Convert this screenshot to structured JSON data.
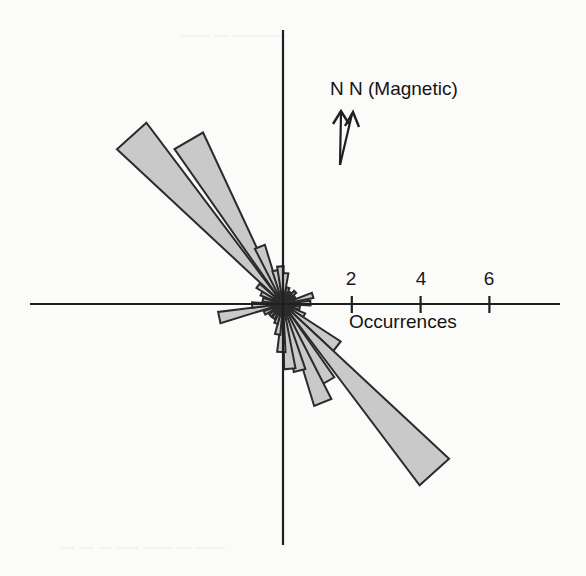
{
  "figure": {
    "background_color": "#fbfbfa",
    "petal_fill_color": "#c9c9c9",
    "petal_stroke_color": "#2b2b2b",
    "axis_color": "#1f1f1f"
  },
  "axis": {
    "title": "Occurrences",
    "tick_labels": [
      "2",
      "4",
      "6"
    ],
    "tick_values": [
      2,
      4,
      6
    ]
  },
  "north_marker": {
    "label": "N N (Magnetic)",
    "true_north_name": "N",
    "magnetic_north_name": "N (Magnetic)"
  },
  "bleed_through": {
    "top": "~~~~ ~~ ~~~~~~~",
    "bottom": "~~ ~~ ~~ ~~~ ~~~~ ~~ ~~~~"
  },
  "chart_data": {
    "type": "bar",
    "title": "",
    "subtitle": "",
    "chart_subtype": "rose-diagram",
    "xlabel": "Occurrences",
    "ylabel": "",
    "rlim": [
      0,
      7
    ],
    "grid": false,
    "legend": "none",
    "angle_convention": "degrees clockwise from north (up); bidirectional rose",
    "bin_width_deg": 10,
    "radial_ticks": [
      2,
      4,
      6
    ],
    "annotations": [
      "N N (Magnetic)",
      "Occurrences"
    ],
    "categories": [
      "315",
      "325",
      "5",
      "15",
      "25",
      "35",
      "45",
      "55",
      "65",
      "75",
      "85",
      "95",
      "105",
      "115",
      "125",
      "135",
      "145",
      "155",
      "165",
      "175",
      "185",
      "195",
      "205",
      "215",
      "225",
      "235",
      "245",
      "255",
      "265",
      "275",
      "285",
      "295",
      "305"
    ],
    "series": [
      {
        "name": "Occurrences",
        "values": [
          6.6,
          5.8,
          1.0,
          0.6,
          1.1,
          0.5,
          0.4,
          0.9,
          0.6,
          0.3,
          0.5,
          0.6,
          0.9,
          1.2,
          2.1,
          3.0,
          2.4,
          1.6,
          1.0,
          0.7,
          0.5,
          0.4,
          0.5,
          0.7,
          1.2,
          6.6,
          2.0,
          1.4,
          0.8,
          0.5,
          0.6,
          1.4,
          2.1
        ]
      }
    ],
    "petals": [
      {
        "angle_deg": 318,
        "length": 6.6
      },
      {
        "angle_deg": 330,
        "length": 5.5
      },
      {
        "angle_deg": 338,
        "length": 1.8
      },
      {
        "angle_deg": 347,
        "length": 1.0
      },
      {
        "angle_deg": 356,
        "length": 1.1
      },
      {
        "angle_deg": 5,
        "length": 0.9
      },
      {
        "angle_deg": 17,
        "length": 0.5
      },
      {
        "angle_deg": 30,
        "length": 0.4
      },
      {
        "angle_deg": 45,
        "length": 0.5
      },
      {
        "angle_deg": 60,
        "length": 0.4
      },
      {
        "angle_deg": 74,
        "length": 0.9
      },
      {
        "angle_deg": 88,
        "length": 0.8
      },
      {
        "angle_deg": 104,
        "length": 0.5
      },
      {
        "angle_deg": 118,
        "length": 0.7
      },
      {
        "angle_deg": 128,
        "length": 2.0
      },
      {
        "angle_deg": 138,
        "length": 6.6
      },
      {
        "angle_deg": 150,
        "length": 2.6
      },
      {
        "angle_deg": 158,
        "length": 3.1
      },
      {
        "angle_deg": 166,
        "length": 2.0
      },
      {
        "angle_deg": 174,
        "length": 1.9
      },
      {
        "angle_deg": 182,
        "length": 1.4
      },
      {
        "angle_deg": 190,
        "length": 0.9
      },
      {
        "angle_deg": 200,
        "length": 0.6
      },
      {
        "angle_deg": 214,
        "length": 0.5
      },
      {
        "angle_deg": 228,
        "length": 0.5
      },
      {
        "angle_deg": 244,
        "length": 0.6
      },
      {
        "angle_deg": 258,
        "length": 1.9
      },
      {
        "angle_deg": 268,
        "length": 0.9
      },
      {
        "angle_deg": 282,
        "length": 0.6
      },
      {
        "angle_deg": 296,
        "length": 0.7
      },
      {
        "angle_deg": 306,
        "length": 0.9
      }
    ]
  }
}
